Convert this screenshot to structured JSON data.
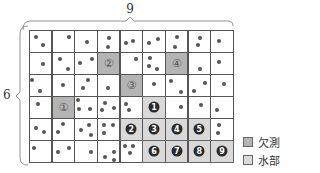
{
  "dimensions": {
    "width_label": "9",
    "height_label": "6",
    "cols": 9,
    "rows": 6
  },
  "colors": {
    "missing": "#b4b4b4",
    "water": "#d9d9d9",
    "dot": "#555555"
  },
  "legend": [
    {
      "label": "欠測",
      "type": "missing"
    },
    {
      "label": "水部",
      "type": "water"
    }
  ],
  "missing_cells": [
    {
      "label": "①",
      "col": 1,
      "row": 3
    },
    {
      "label": "②",
      "col": 3,
      "row": 1
    },
    {
      "label": "③",
      "col": 4,
      "row": 2
    },
    {
      "label": "④",
      "col": 6,
      "row": 1
    }
  ],
  "water_cells": [
    {
      "label": "1",
      "col": 5,
      "row": 3
    },
    {
      "label": "2",
      "col": 4,
      "row": 4
    },
    {
      "label": "3",
      "col": 5,
      "row": 4
    },
    {
      "label": "4",
      "col": 6,
      "row": 4
    },
    {
      "label": "5",
      "col": 7,
      "row": 4
    },
    {
      "label": "6",
      "col": 5,
      "row": 5
    },
    {
      "label": "7",
      "col": 6,
      "row": 5
    },
    {
      "label": "8",
      "col": 7,
      "row": 5
    },
    {
      "label": "9",
      "col": 8,
      "row": 5
    }
  ],
  "dots": [
    [
      0,
      0,
      0.3,
      0.3
    ],
    [
      0,
      0,
      0.6,
      0.7
    ],
    [
      1,
      0,
      0.75,
      0.3
    ],
    [
      2,
      0,
      0.55,
      0.55
    ],
    [
      3,
      0,
      0.55,
      0.35
    ],
    [
      3,
      0,
      0.5,
      0.75
    ],
    [
      4,
      0,
      0.3,
      0.6
    ],
    [
      4,
      0,
      0.6,
      0.5
    ],
    [
      5,
      0,
      0.3,
      0.6
    ],
    [
      5,
      0,
      0.7,
      0.4
    ],
    [
      6,
      0,
      0.55,
      0.3
    ],
    [
      6,
      0,
      0.45,
      0.75
    ],
    [
      7,
      0,
      0.55,
      0.35
    ],
    [
      7,
      0,
      0.45,
      0.7
    ],
    [
      8,
      0,
      0.4,
      0.5
    ],
    [
      0,
      1,
      0.6,
      0.55
    ],
    [
      1,
      1,
      0.35,
      0.3
    ],
    [
      1,
      1,
      0.7,
      0.75
    ],
    [
      2,
      1,
      0.25,
      0.5
    ],
    [
      2,
      1,
      0.8,
      0.3
    ],
    [
      4,
      1,
      0.7,
      0.3
    ],
    [
      5,
      1,
      0.35,
      0.25
    ],
    [
      5,
      1,
      0.3,
      0.65
    ],
    [
      5,
      1,
      0.65,
      0.75
    ],
    [
      7,
      1,
      0.55,
      0.75
    ],
    [
      8,
      1,
      0.4,
      0.45
    ],
    [
      0,
      2,
      0.15,
      0.25
    ],
    [
      0,
      2,
      0.5,
      0.75
    ],
    [
      1,
      2,
      0.5,
      0.5
    ],
    [
      2,
      2,
      0.6,
      0.25
    ],
    [
      2,
      2,
      0.4,
      0.65
    ],
    [
      3,
      2,
      0.5,
      0.65
    ],
    [
      5,
      2,
      0.5,
      0.45
    ],
    [
      6,
      2,
      0.25,
      0.3
    ],
    [
      6,
      2,
      0.7,
      0.8
    ],
    [
      7,
      2,
      0.3,
      0.75
    ],
    [
      7,
      2,
      0.75,
      0.4
    ],
    [
      8,
      2,
      0.6,
      0.45
    ],
    [
      0,
      3,
      0.4,
      0.35
    ],
    [
      2,
      3,
      0.15,
      0.2
    ],
    [
      2,
      3,
      0.2,
      0.6
    ],
    [
      2,
      3,
      0.7,
      0.6
    ],
    [
      3,
      3,
      0.35,
      0.3
    ],
    [
      3,
      3,
      0.2,
      0.65
    ],
    [
      3,
      3,
      0.75,
      0.55
    ],
    [
      4,
      3,
      0.4,
      0.65
    ],
    [
      4,
      3,
      0.3,
      0.35
    ],
    [
      6,
      3,
      0.7,
      0.5
    ],
    [
      7,
      3,
      0.6,
      0.4
    ],
    [
      8,
      3,
      0.3,
      0.65
    ],
    [
      0,
      4,
      0.3,
      0.45
    ],
    [
      0,
      4,
      0.65,
      0.65
    ],
    [
      1,
      4,
      0.5,
      0.25
    ],
    [
      1,
      4,
      0.3,
      0.65
    ],
    [
      2,
      4,
      0.3,
      0.55
    ],
    [
      2,
      4,
      0.65,
      0.3
    ],
    [
      2,
      4,
      0.75,
      0.75
    ],
    [
      3,
      4,
      0.3,
      0.3
    ],
    [
      3,
      4,
      0.7,
      0.3
    ],
    [
      3,
      4,
      0.3,
      0.7
    ],
    [
      8,
      4,
      0.4,
      0.3
    ],
    [
      8,
      4,
      0.35,
      0.7
    ],
    [
      0,
      5,
      0.2,
      0.35
    ],
    [
      1,
      5,
      0.3,
      0.55
    ],
    [
      1,
      5,
      0.75,
      0.35
    ],
    [
      2,
      5,
      0.75,
      0.55
    ],
    [
      3,
      5,
      0.35,
      0.75
    ],
    [
      3,
      5,
      0.75,
      0.55
    ],
    [
      3,
      5,
      0.75,
      0.9
    ],
    [
      4,
      5,
      0.25,
      0.25
    ],
    [
      4,
      5,
      0.6,
      0.25
    ],
    [
      4,
      5,
      0.45,
      0.6
    ]
  ]
}
